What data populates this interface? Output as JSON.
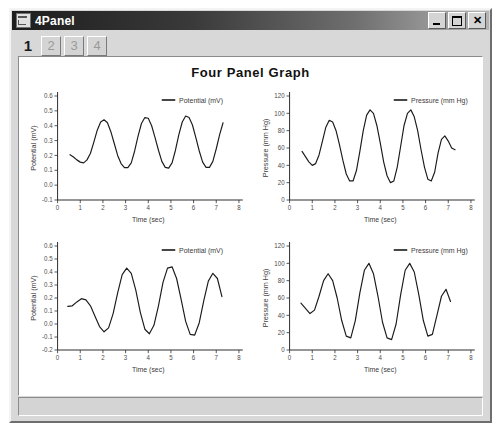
{
  "window": {
    "title": "4Panel",
    "icon": "app-icon",
    "controls": {
      "minimize": "_",
      "maximize": "□",
      "close": "✕"
    }
  },
  "tabs": [
    {
      "label": "1",
      "active": true
    },
    {
      "label": "2",
      "active": false
    },
    {
      "label": "3",
      "active": false
    },
    {
      "label": "4",
      "active": false
    }
  ],
  "graph_title": "Four Panel Graph",
  "chart_data": [
    {
      "type": "line",
      "panel": "top-left",
      "title": "",
      "xlabel": "Time (sec)",
      "ylabel": "Potential (mV)",
      "legend": [
        "Potential (mV)"
      ],
      "legend_position": "top-right",
      "grid": false,
      "xlim": [
        0,
        8
      ],
      "ylim": [
        -0.1,
        0.6
      ],
      "xticks": [
        "0",
        "1",
        "2",
        "3",
        "4",
        "5",
        "6",
        "7",
        "8"
      ],
      "yticks": [
        "-0.1",
        "0.0",
        "0.1",
        "0.2",
        "0.3",
        "0.4",
        "0.5",
        "0.6"
      ],
      "series": [
        {
          "name": "Potential (mV)",
          "color": "#1a1a1a",
          "x": [
            0.55,
            0.7,
            0.85,
            1.0,
            1.15,
            1.3,
            1.45,
            1.6,
            1.75,
            1.9,
            2.05,
            2.2,
            2.35,
            2.5,
            2.65,
            2.8,
            2.95,
            3.1,
            3.25,
            3.4,
            3.55,
            3.7,
            3.85,
            4.0,
            4.15,
            4.3,
            4.45,
            4.6,
            4.75,
            4.9,
            5.05,
            5.2,
            5.35,
            5.5,
            5.65,
            5.8,
            5.95,
            6.1,
            6.25,
            6.4,
            6.55,
            6.7,
            6.85,
            7.0,
            7.15,
            7.3
          ],
          "y": [
            0.205,
            0.19,
            0.17,
            0.155,
            0.15,
            0.17,
            0.215,
            0.29,
            0.37,
            0.425,
            0.44,
            0.42,
            0.36,
            0.28,
            0.2,
            0.145,
            0.118,
            0.118,
            0.15,
            0.23,
            0.33,
            0.415,
            0.455,
            0.45,
            0.4,
            0.32,
            0.235,
            0.16,
            0.12,
            0.115,
            0.15,
            0.235,
            0.34,
            0.425,
            0.465,
            0.455,
            0.405,
            0.32,
            0.23,
            0.155,
            0.12,
            0.12,
            0.16,
            0.245,
            0.34,
            0.42
          ]
        }
      ]
    },
    {
      "type": "line",
      "panel": "top-right",
      "title": "",
      "xlabel": "Time (sec)",
      "ylabel": "Pressure (mm Hg)",
      "legend": [
        "Pressure (mm Hg)"
      ],
      "legend_position": "top-right",
      "grid": false,
      "xlim": [
        0,
        8
      ],
      "ylim": [
        0,
        120
      ],
      "xticks": [
        "0",
        "1",
        "2",
        "3",
        "4",
        "5",
        "6",
        "7",
        "8"
      ],
      "yticks": [
        "0",
        "20",
        "40",
        "60",
        "80",
        "100",
        "120"
      ],
      "series": [
        {
          "name": "Pressure (mm Hg)",
          "color": "#1a1a1a",
          "x": [
            0.55,
            0.7,
            0.85,
            1.0,
            1.15,
            1.3,
            1.45,
            1.6,
            1.75,
            1.9,
            2.05,
            2.2,
            2.35,
            2.5,
            2.65,
            2.8,
            2.95,
            3.1,
            3.25,
            3.4,
            3.55,
            3.7,
            3.85,
            4.0,
            4.15,
            4.3,
            4.45,
            4.6,
            4.75,
            4.9,
            5.05,
            5.2,
            5.35,
            5.5,
            5.65,
            5.8,
            5.95,
            6.1,
            6.25,
            6.4,
            6.55,
            6.7,
            6.85,
            7.0,
            7.15,
            7.3
          ],
          "y": [
            56,
            50,
            44,
            40,
            42,
            52,
            68,
            84,
            92,
            90,
            80,
            64,
            46,
            30,
            22,
            22,
            34,
            56,
            80,
            98,
            104,
            100,
            86,
            66,
            44,
            28,
            20,
            22,
            38,
            62,
            86,
            100,
            104,
            96,
            80,
            58,
            38,
            24,
            22,
            32,
            54,
            70,
            74,
            68,
            60,
            58
          ]
        }
      ]
    },
    {
      "type": "line",
      "panel": "bottom-left",
      "title": "",
      "xlabel": "Time (sec)",
      "ylabel": "Potential (mV)",
      "legend": [
        "Potential (mV)"
      ],
      "legend_position": "top-right",
      "grid": false,
      "xlim": [
        0,
        8
      ],
      "ylim": [
        -0.2,
        0.6
      ],
      "xticks": [
        "0",
        "1",
        "2",
        "3",
        "4",
        "5",
        "6",
        "7",
        "8"
      ],
      "yticks": [
        "-0.2",
        "-0.1",
        "0.0",
        "0.1",
        "0.2",
        "0.3",
        "0.4",
        "0.5",
        "0.6"
      ],
      "series": [
        {
          "name": "Potential (mV)",
          "color": "#1a1a1a",
          "x": [
            0.45,
            0.65,
            0.85,
            1.05,
            1.25,
            1.45,
            1.65,
            1.85,
            2.05,
            2.25,
            2.45,
            2.65,
            2.85,
            3.05,
            3.25,
            3.45,
            3.65,
            3.85,
            4.05,
            4.25,
            4.45,
            4.65,
            4.85,
            5.05,
            5.25,
            5.45,
            5.65,
            5.85,
            6.05,
            6.25,
            6.45,
            6.65,
            6.85,
            7.05,
            7.25
          ],
          "y": [
            0.135,
            0.14,
            0.17,
            0.195,
            0.185,
            0.14,
            0.06,
            -0.02,
            -0.06,
            -0.03,
            0.08,
            0.24,
            0.38,
            0.43,
            0.39,
            0.26,
            0.09,
            -0.04,
            -0.075,
            -0.01,
            0.14,
            0.32,
            0.43,
            0.44,
            0.35,
            0.19,
            0.02,
            -0.08,
            -0.085,
            0.01,
            0.18,
            0.33,
            0.39,
            0.35,
            0.21
          ]
        }
      ]
    },
    {
      "type": "line",
      "panel": "bottom-right",
      "title": "",
      "xlabel": "Time (sec)",
      "ylabel": "Pressure (mm Hg)",
      "legend": [
        "Pressure (mm Hg)"
      ],
      "legend_position": "top-right",
      "grid": false,
      "xlim": [
        0,
        8
      ],
      "ylim": [
        0,
        120
      ],
      "xticks": [
        "0",
        "1",
        "2",
        "3",
        "4",
        "5",
        "6",
        "7",
        "8"
      ],
      "yticks": [
        "0",
        "20",
        "40",
        "60",
        "80",
        "100",
        "120"
      ],
      "series": [
        {
          "name": "Pressure (mm Hg)",
          "color": "#1a1a1a",
          "x": [
            0.5,
            0.7,
            0.9,
            1.1,
            1.3,
            1.5,
            1.7,
            1.9,
            2.1,
            2.3,
            2.5,
            2.7,
            2.9,
            3.1,
            3.3,
            3.5,
            3.7,
            3.9,
            4.1,
            4.3,
            4.5,
            4.7,
            4.9,
            5.1,
            5.3,
            5.5,
            5.7,
            5.9,
            6.1,
            6.3,
            6.5,
            6.7,
            6.9,
            7.1
          ],
          "y": [
            54,
            48,
            42,
            46,
            62,
            80,
            88,
            80,
            60,
            34,
            16,
            14,
            34,
            66,
            92,
            100,
            88,
            62,
            32,
            14,
            12,
            30,
            64,
            92,
            100,
            90,
            64,
            34,
            16,
            18,
            40,
            62,
            70,
            56
          ]
        }
      ]
    }
  ],
  "statusbar": {
    "text": ""
  }
}
